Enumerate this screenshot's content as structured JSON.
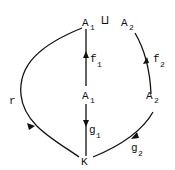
{
  "diagram": {
    "nodes": {
      "top_left": {
        "base": "A",
        "sub": "1"
      },
      "coproduct_symbol": "⨿",
      "top_right": {
        "base": "A",
        "sub": "2"
      },
      "mid_left": {
        "base": "A",
        "sub": "1"
      },
      "mid_right": {
        "base": "A",
        "sub": "2"
      },
      "bottom": {
        "base": "K"
      }
    },
    "arrows": {
      "f1": {
        "base": "f",
        "sub": "1"
      },
      "f2": {
        "base": "f",
        "sub": "2"
      },
      "g1": {
        "base": "g",
        "sub": "1"
      },
      "g2": {
        "base": "g",
        "sub": "2"
      },
      "r": {
        "base": "r"
      }
    },
    "line_color": "#111111"
  }
}
